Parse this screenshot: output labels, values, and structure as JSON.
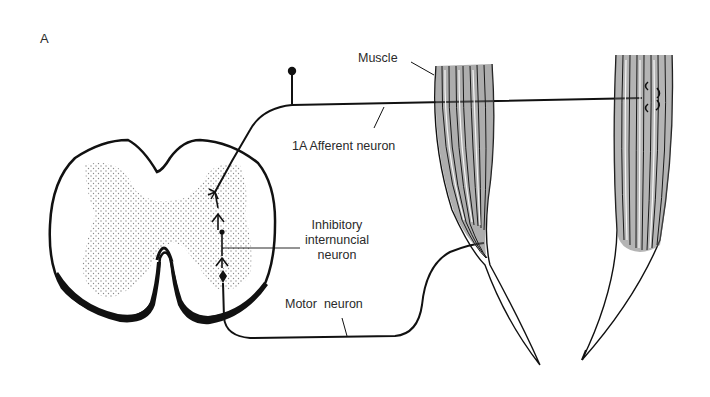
{
  "figure": {
    "panel_label": "A"
  },
  "labels": {
    "muscle": "Muscle",
    "afferent": "1A Afferent neuron",
    "inhibitory_line1": "Inhibitory",
    "inhibitory_line2": "internuncial",
    "inhibitory_line3": "neuron",
    "motor": "Motor  neuron"
  },
  "components": [
    {
      "id": "spinal-cord",
      "type": "cross-section",
      "gray_matter": "stippled"
    },
    {
      "id": "afferent-neuron",
      "type": "axon",
      "cell_body": "dorsal-root-ganglion"
    },
    {
      "id": "inhibitory-interneuron",
      "type": "synapse-chain"
    },
    {
      "id": "motor-neuron",
      "type": "axon"
    },
    {
      "id": "muscle-left",
      "type": "muscle",
      "innervated_by": "motor-neuron"
    },
    {
      "id": "muscle-right",
      "type": "muscle",
      "receptor": "muscle-spindle"
    }
  ],
  "colors": {
    "ink": "#111111",
    "stipple": "#9a9a9a",
    "muscle_shade": "#555555",
    "background": "#ffffff"
  }
}
